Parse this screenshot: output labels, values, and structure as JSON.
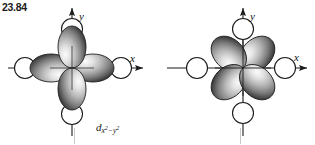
{
  "figure": {
    "problem_number": "23.84",
    "background_color": "#ffffff",
    "ink_color": "#1a1a1a",
    "lobe_dark": "#2b2b2b",
    "lobe_light": "#f2f2f2"
  },
  "panels": [
    {
      "id": "panel-left",
      "orbital_name": "d",
      "orbital_subscript": "x²−y²",
      "label_parts": {
        "d": "d",
        "sub_x": "x",
        "sup_2a": "2",
        "minus": "−",
        "sub_y": "y",
        "sup_2b": "2"
      },
      "axis_x_label": "x",
      "axis_y_label": "y",
      "lobe_orientation_degrees": [
        0,
        90,
        180,
        270
      ],
      "lobe_count": 4,
      "node_circle_count": 4,
      "node_circle_positions": [
        "+x",
        "-x",
        "+y",
        "-y"
      ]
    },
    {
      "id": "panel-right",
      "orbital_name": "d",
      "orbital_subscript": "xy",
      "label_parts": {
        "d": "d",
        "sub_xy": "xy"
      },
      "axis_x_label": "x",
      "axis_y_label": "y",
      "lobe_orientation_degrees": [
        45,
        135,
        225,
        315
      ],
      "lobe_count": 4,
      "node_circle_count": 4,
      "node_circle_positions": [
        "+x",
        "-x",
        "+y",
        "-y"
      ]
    }
  ]
}
